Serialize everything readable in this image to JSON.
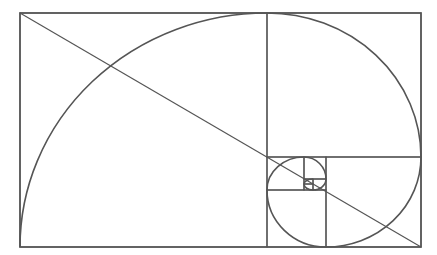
{
  "diagram": {
    "type": "golden-rectangle-spiral",
    "frame": {
      "x": 20,
      "y": 13,
      "width": 401,
      "height": 234
    },
    "stroke_color": "#555555",
    "background": "#ffffff",
    "squares": [
      {
        "x": 20,
        "y": 13,
        "w": 247,
        "h": 234
      },
      {
        "x": 267,
        "y": 13,
        "w": 154,
        "h": 144
      },
      {
        "x": 326,
        "y": 157,
        "w": 95,
        "h": 90
      },
      {
        "x": 267,
        "y": 190,
        "w": 59,
        "h": 57
      },
      {
        "x": 267,
        "y": 157,
        "w": 37,
        "h": 33
      },
      {
        "x": 304,
        "y": 157,
        "w": 22,
        "h": 22
      },
      {
        "x": 313,
        "y": 179,
        "w": 13,
        "h": 11
      },
      {
        "x": 304,
        "y": 184,
        "w": 9,
        "h": 6
      },
      {
        "x": 304,
        "y": 179,
        "w": 9,
        "h": 5
      }
    ],
    "diagonal": {
      "x1": 20,
      "y1": 13,
      "x2": 421,
      "y2": 247
    }
  }
}
